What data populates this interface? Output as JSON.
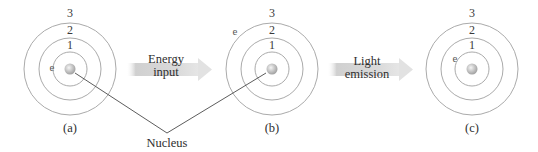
{
  "figure": {
    "atoms": [
      {
        "id": "a",
        "caption": "(a)",
        "orbit_labels": [
          "1",
          "2",
          "3"
        ],
        "electron_label": "e",
        "electron_orbit": 1
      },
      {
        "id": "b",
        "caption": "(b)",
        "orbit_labels": [
          "1",
          "2",
          "3"
        ],
        "electron_label": "e",
        "electron_orbit": 3
      },
      {
        "id": "c",
        "caption": "(c)",
        "orbit_labels": [
          "1",
          "2",
          "3"
        ],
        "electron_label": "e",
        "electron_orbit": 1
      }
    ],
    "arrows": [
      {
        "line1": "Energy",
        "line2": "input"
      },
      {
        "line1": "Light",
        "line2": "emission"
      }
    ],
    "callout": {
      "label": "Nucleus"
    },
    "colors": {
      "orbit": "#9a9a9a",
      "nucleus": "#b8b8b8",
      "nucleus_highlight": "#f2f2f2",
      "arrow": "#cfcfcf",
      "leader_line": "#4a4a4a",
      "text": "#333333"
    }
  }
}
